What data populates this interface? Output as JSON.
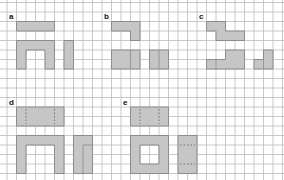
{
  "diagram": {
    "grid": {
      "origin_x": 7,
      "origin_y": 12,
      "cell": 9.5,
      "cols": 29,
      "rows": 18,
      "line_color": "#bdbdbd",
      "background": "#ffffff"
    },
    "colors": {
      "fill": "#c6c6c6",
      "outline": "#8c8c8c",
      "dash": "#6e6e6e"
    },
    "panels": [
      {
        "label": "a",
        "label_cell": [
          0,
          0
        ],
        "shapes": [
          {
            "name": "top-bar",
            "cells": [
              [
                1,
                1
              ],
              [
                2,
                1
              ],
              [
                3,
                1
              ],
              [
                4,
                1
              ]
            ]
          },
          {
            "name": "arch",
            "cells": [
              [
                1,
                3
              ],
              [
                2,
                3
              ],
              [
                3,
                3
              ],
              [
                4,
                3
              ],
              [
                1,
                4
              ],
              [
                4,
                4
              ],
              [
                1,
                5
              ],
              [
                4,
                5
              ]
            ]
          },
          {
            "name": "vertical-bar",
            "cells": [
              [
                6,
                3
              ],
              [
                6,
                4
              ],
              [
                6,
                5
              ]
            ]
          }
        ]
      },
      {
        "label": "b",
        "label_cell": [
          10,
          0
        ],
        "shapes": [
          {
            "name": "l-shape",
            "cells": [
              [
                11,
                1
              ],
              [
                12,
                1
              ],
              [
                13,
                1
              ],
              [
                13,
                2
              ]
            ]
          },
          {
            "name": "block-left",
            "cells": [
              [
                11,
                4
              ],
              [
                12,
                4
              ],
              [
                13,
                4
              ],
              [
                11,
                5
              ],
              [
                12,
                5
              ],
              [
                13,
                5
              ]
            ],
            "dividers": [
              {
                "type": "v",
                "x": 13,
                "y1": 4,
                "y2": 6
              }
            ]
          },
          {
            "name": "block-right",
            "cells": [
              [
                15,
                4
              ],
              [
                16,
                4
              ],
              [
                15,
                5
              ],
              [
                16,
                5
              ]
            ],
            "dividers": [
              {
                "type": "v",
                "x": 16,
                "y1": 4,
                "y2": 6
              }
            ]
          }
        ]
      },
      {
        "label": "c",
        "label_cell": [
          20,
          0
        ],
        "shapes": [
          {
            "name": "z-shape",
            "cells": [
              [
                21,
                1
              ],
              [
                22,
                1
              ],
              [
                22,
                2
              ],
              [
                23,
                2
              ],
              [
                24,
                2
              ]
            ]
          },
          {
            "name": "step-shape",
            "cells": [
              [
                23,
                4
              ],
              [
                24,
                4
              ],
              [
                21,
                5
              ],
              [
                22,
                5
              ],
              [
                23,
                5
              ],
              [
                24,
                5
              ]
            ],
            "dividers": [
              {
                "type": "v",
                "x": 22,
                "y1": 5,
                "y2": 6
              }
            ]
          },
          {
            "name": "small-step",
            "cells": [
              [
                27,
                4
              ],
              [
                26,
                5
              ],
              [
                27,
                5
              ]
            ],
            "dividers": [
              {
                "type": "v",
                "x": 27,
                "y1": 5,
                "y2": 6
              }
            ]
          }
        ]
      },
      {
        "label": "d",
        "label_cell": [
          0,
          9
        ],
        "shapes": [
          {
            "name": "top-block",
            "cells": [
              [
                1,
                10
              ],
              [
                2,
                10
              ],
              [
                3,
                10
              ],
              [
                4,
                10
              ],
              [
                5,
                10
              ],
              [
                1,
                11
              ],
              [
                2,
                11
              ],
              [
                3,
                11
              ],
              [
                4,
                11
              ],
              [
                5,
                11
              ]
            ],
            "dashes": [
              {
                "type": "v",
                "x": 2,
                "y1": 10,
                "y2": 12
              },
              {
                "type": "v",
                "x": 5,
                "y1": 10,
                "y2": 12
              }
            ]
          },
          {
            "name": "arch",
            "cells": [
              [
                1,
                13
              ],
              [
                2,
                13
              ],
              [
                3,
                13
              ],
              [
                4,
                13
              ],
              [
                5,
                13
              ],
              [
                1,
                14
              ],
              [
                5,
                14
              ],
              [
                1,
                15
              ],
              [
                5,
                15
              ],
              [
                1,
                16
              ],
              [
                5,
                16
              ]
            ]
          },
          {
            "name": "side-piece",
            "cells": [
              [
                7,
                13
              ],
              [
                8,
                13
              ],
              [
                7,
                14
              ],
              [
                8,
                14
              ],
              [
                7,
                15
              ],
              [
                8,
                15
              ],
              [
                7,
                16
              ],
              [
                8,
                16
              ]
            ],
            "dividers": [
              {
                "type": "v",
                "x": 8,
                "y1": 14,
                "y2": 17
              },
              {
                "type": "h",
                "y": 14,
                "x1": 8,
                "x2": 9
              }
            ]
          }
        ]
      },
      {
        "label": "e",
        "label_cell": [
          12,
          9
        ],
        "shapes": [
          {
            "name": "top-block",
            "cells": [
              [
                13,
                10
              ],
              [
                14,
                10
              ],
              [
                15,
                10
              ],
              [
                16,
                10
              ],
              [
                13,
                11
              ],
              [
                14,
                11
              ],
              [
                15,
                11
              ],
              [
                16,
                11
              ]
            ],
            "dashes": [
              {
                "type": "v",
                "x": 14,
                "y1": 10,
                "y2": 12
              },
              {
                "type": "v",
                "x": 16,
                "y1": 10,
                "y2": 12
              }
            ]
          },
          {
            "name": "frame",
            "cells": [
              [
                13,
                13
              ],
              [
                14,
                13
              ],
              [
                15,
                13
              ],
              [
                16,
                13
              ],
              [
                13,
                14
              ],
              [
                16,
                14
              ],
              [
                13,
                15
              ],
              [
                16,
                15
              ],
              [
                13,
                16
              ],
              [
                14,
                16
              ],
              [
                15,
                16
              ],
              [
                16,
                16
              ]
            ]
          },
          {
            "name": "side-block",
            "cells": [
              [
                18,
                13
              ],
              [
                19,
                13
              ],
              [
                18,
                14
              ],
              [
                19,
                14
              ],
              [
                18,
                15
              ],
              [
                19,
                15
              ],
              [
                18,
                16
              ],
              [
                19,
                16
              ]
            ],
            "dashes": [
              {
                "type": "h",
                "y": 14,
                "x1": 18,
                "x2": 20
              },
              {
                "type": "h",
                "y": 16,
                "x1": 18,
                "x2": 20
              }
            ]
          }
        ]
      }
    ]
  }
}
